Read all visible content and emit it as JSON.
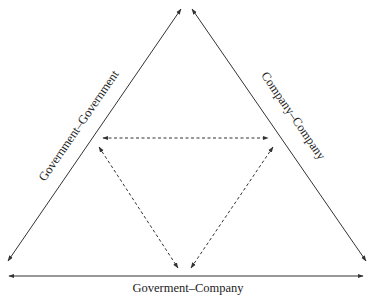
{
  "diagram": {
    "type": "triangle-relationship",
    "colors": {
      "line": "#333333",
      "text": "#222222",
      "background": "#ffffff"
    },
    "outer_edges": [
      {
        "id": "left",
        "label": "Government–Government",
        "style": "solid",
        "arrows": "both"
      },
      {
        "id": "right",
        "label": "Company–Company",
        "style": "solid",
        "arrows": "both"
      },
      {
        "id": "bottom",
        "label": "Goverment–Company",
        "style": "solid",
        "arrows": "both"
      }
    ],
    "inner_edges": [
      {
        "id": "inner-top",
        "style": "dashed",
        "arrows": "both"
      },
      {
        "id": "inner-left",
        "style": "dashed",
        "arrows": "both"
      },
      {
        "id": "inner-right",
        "style": "dashed",
        "arrows": "both"
      }
    ]
  }
}
